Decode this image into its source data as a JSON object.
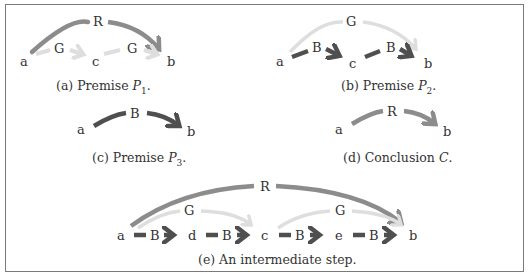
{
  "colors": {
    "R": "#8c8c8c",
    "G": "#dedede",
    "B": "#4f4f4f",
    "border": "#7a7a7a"
  },
  "panels": {
    "a": {
      "caption_prefix": "(a) Premise ",
      "caption_var": "P",
      "caption_sub": "1",
      "caption_suffix": ".",
      "nodes": [
        "a",
        "c",
        "b"
      ],
      "edges": [
        {
          "label": "G",
          "from": "a",
          "to": "c"
        },
        {
          "label": "G",
          "from": "c",
          "to": "b"
        },
        {
          "label": "R",
          "from": "a",
          "to": "b"
        }
      ]
    },
    "b": {
      "caption_prefix": "(b) Premise ",
      "caption_var": "P",
      "caption_sub": "2",
      "caption_suffix": ".",
      "nodes": [
        "a",
        "c",
        "b"
      ],
      "edges": [
        {
          "label": "B",
          "from": "a",
          "to": "c"
        },
        {
          "label": "B",
          "from": "c",
          "to": "b"
        },
        {
          "label": "G",
          "from": "a",
          "to": "b"
        }
      ]
    },
    "c": {
      "caption_prefix": "(c) Premise ",
      "caption_var": "P",
      "caption_sub": "3",
      "caption_suffix": ".",
      "nodes": [
        "a",
        "b"
      ],
      "edges": [
        {
          "label": "B",
          "from": "a",
          "to": "b"
        }
      ]
    },
    "d": {
      "caption_prefix": "(d) Conclusion ",
      "caption_var": "C",
      "caption_sub": "",
      "caption_suffix": ".",
      "nodes": [
        "a",
        "b"
      ],
      "edges": [
        {
          "label": "R",
          "from": "a",
          "to": "b"
        }
      ]
    },
    "e": {
      "caption_prefix": "(e) An intermediate step.",
      "nodes": [
        "a",
        "d",
        "c",
        "e",
        "b"
      ],
      "edges": [
        {
          "label": "B",
          "from": "a",
          "to": "d"
        },
        {
          "label": "B",
          "from": "d",
          "to": "c"
        },
        {
          "label": "B",
          "from": "c",
          "to": "e"
        },
        {
          "label": "B",
          "from": "e",
          "to": "b"
        },
        {
          "label": "G",
          "from": "a",
          "to": "c"
        },
        {
          "label": "G",
          "from": "c",
          "to": "b"
        },
        {
          "label": "R",
          "from": "a",
          "to": "b"
        }
      ]
    }
  }
}
